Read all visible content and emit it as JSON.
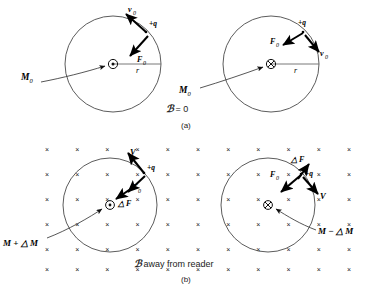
{
  "figure": {
    "panels": [
      {
        "id": "a",
        "caption": "(a)",
        "field_label_script": "ℬ",
        "field_label_text": "= 0",
        "field_state": "zero",
        "circles": [
          {
            "id": "a-left",
            "center_symbol": "dot",
            "center_symbol_meaning": "out-of-page",
            "radius_label": "r",
            "moment_label": "M",
            "moment_sub": "0",
            "charge_label": "+q",
            "vectors": [
              {
                "name": "v0",
                "label": "v",
                "sub": "0",
                "direction": "up-left-tangent"
              },
              {
                "name": "F0",
                "label": "F",
                "sub": "0",
                "direction": "down-left-centripetal"
              }
            ]
          },
          {
            "id": "a-right",
            "center_symbol": "cross",
            "center_symbol_meaning": "into-page",
            "radius_label": "r",
            "moment_label": "M",
            "moment_sub": "0",
            "charge_label": "+q",
            "vectors": [
              {
                "name": "F0",
                "label": "F",
                "sub": "0",
                "direction": "down-left-centripetal"
              },
              {
                "name": "v0",
                "label": "v",
                "sub": "0",
                "direction": "down-right-tangent"
              }
            ]
          }
        ]
      },
      {
        "id": "b",
        "caption": "(b)",
        "field_label_script": "ℬ",
        "field_label_text": "away from reader",
        "field_state": "into-page",
        "field_mark_glyph": "×",
        "circles": [
          {
            "id": "b-left",
            "center_symbol": "dot",
            "center_symbol_meaning": "out-of-page",
            "moment_label": "M + △ M",
            "charge_label": "+q",
            "vectors": [
              {
                "name": "V",
                "label": "V",
                "sub": "",
                "direction": "up-left-tangent"
              },
              {
                "name": "F0",
                "label": "F",
                "sub": "0",
                "direction": "down-left-centripetal"
              },
              {
                "name": "dF",
                "label": "△ F",
                "sub": "",
                "direction": "down-left-added"
              }
            ]
          },
          {
            "id": "b-right",
            "center_symbol": "cross",
            "center_symbol_meaning": "into-page",
            "moment_label": "M − △ M",
            "charge_label": "+q",
            "vectors": [
              {
                "name": "dF",
                "label": "△ F",
                "sub": "",
                "direction": "up-right-opposed"
              },
              {
                "name": "F0",
                "label": "F",
                "sub": "0",
                "direction": "down-left-centripetal"
              },
              {
                "name": "V",
                "label": "V",
                "sub": "",
                "direction": "down-right-tangent"
              }
            ]
          }
        ]
      }
    ],
    "colors": {
      "stroke": "#3a3a3a",
      "vector": "#000000",
      "text": "#111111",
      "background": "#ffffff"
    }
  }
}
